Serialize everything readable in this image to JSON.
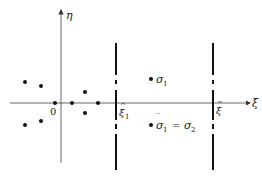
{
  "diagram": {
    "type": "complex-plane-singularities",
    "axes": {
      "horizontal_label": "ξ",
      "vertical_label": "η",
      "origin_label": "0"
    },
    "cut_lines": [
      {
        "label_base": "ξ",
        "label_sub": "1",
        "hat": "^"
      },
      {
        "label_base": "ξ",
        "label_sub": "",
        "hat": "^"
      }
    ],
    "points_labels": {
      "upper": {
        "base": "σ",
        "sub": "1"
      },
      "lower": {
        "lhs_base": "σ",
        "lhs_bar": "‾",
        "lhs_sub": "1",
        "eq": "=",
        "rhs_base": "σ",
        "rhs_sub": "2"
      }
    }
  }
}
